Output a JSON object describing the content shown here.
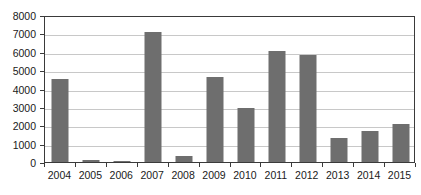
{
  "chart_data": {
    "type": "bar",
    "title": "",
    "subtitle": "",
    "xlabel": "",
    "ylabel": "",
    "categories": [
      "2004",
      "2005",
      "2006",
      "2007",
      "2008",
      "2009",
      "2010",
      "2011",
      "2012",
      "2013",
      "2014",
      "2015"
    ],
    "values": [
      4500,
      100,
      80,
      7050,
      350,
      4600,
      2950,
      6050,
      5850,
      1300,
      1700,
      2050
    ],
    "ylim": [
      0,
      8000
    ],
    "y_ticks": [
      0,
      1000,
      2000,
      3000,
      4000,
      5000,
      6000,
      7000,
      8000
    ],
    "y_tick_labels": [
      "0",
      "1000",
      "2000",
      "3000",
      "4000",
      "5000",
      "6000",
      "7000",
      "8000"
    ],
    "grid": true,
    "legend": false,
    "legend_position": "none",
    "series": [
      {
        "name": "",
        "color": "#6e6e6e",
        "values": [
          4500,
          100,
          80,
          7050,
          350,
          4600,
          2950,
          6050,
          5850,
          1300,
          1700,
          2050
        ]
      }
    ],
    "colors": {
      "bar": "#6e6e6e",
      "gridline": "#c8c8c8",
      "axis": "#3a3a3a",
      "background": "#ffffff",
      "text": "#1a1a1a"
    }
  }
}
